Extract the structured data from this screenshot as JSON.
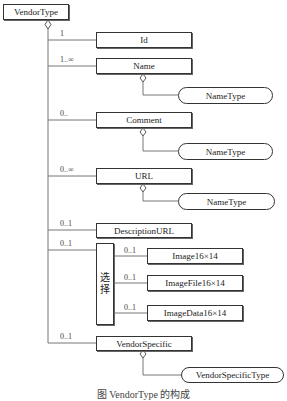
{
  "diagram": {
    "root": {
      "label": "VendorType"
    },
    "elements": [
      {
        "id": "id",
        "label": "Id",
        "multiplicity": "1"
      },
      {
        "id": "name",
        "label": "Name",
        "multiplicity": "1..∞",
        "type": "NameType"
      },
      {
        "id": "comment",
        "label": "Comment",
        "multiplicity": "0..",
        "type": "NameType"
      },
      {
        "id": "url",
        "label": "URL",
        "multiplicity": "0..∞",
        "type": "NameType"
      },
      {
        "id": "descurl",
        "label": "DescriptionURL",
        "multiplicity": "0..1"
      },
      {
        "id": "vendorspecific",
        "label": "VendorSpecific",
        "multiplicity": "0..1",
        "type": "VendorSpecificType"
      }
    ],
    "choice": {
      "label_line1": "选",
      "label_line2": "择",
      "multiplicity": "0..1",
      "options": [
        {
          "label": "Image16×14",
          "multiplicity": "0..1"
        },
        {
          "label": "ImageFile16×14",
          "multiplicity": "0..1"
        },
        {
          "label": "ImageData16×14",
          "multiplicity": "0..1"
        }
      ]
    },
    "caption": "图 VendorType 的构成"
  }
}
